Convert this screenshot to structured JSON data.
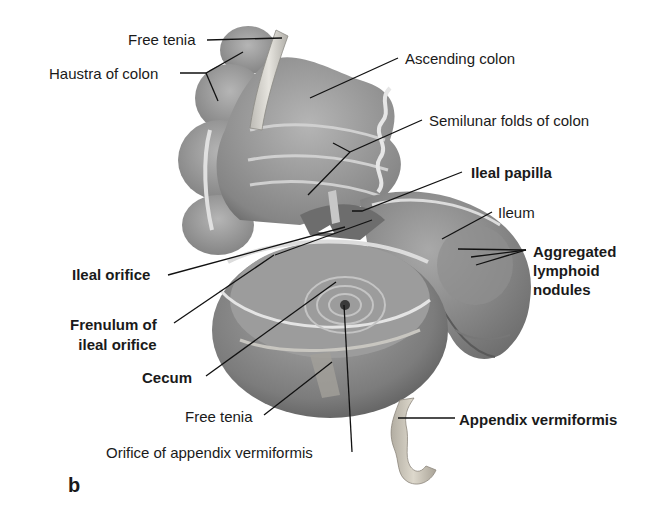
{
  "figure": {
    "panel_letter": "b",
    "colors": {
      "background": "#ffffff",
      "tissue_dark": "#6e6e6e",
      "tissue_mid": "#9a9a9a",
      "tissue_light": "#c8c8c8",
      "tenia_band": "#d8d6d0",
      "appendix": "#c9c4b8",
      "label_text": "#1a1a1a",
      "leader_line": "#111111"
    },
    "labels": [
      {
        "id": "free-tenia-top",
        "text": "Free tenia",
        "bold": false
      },
      {
        "id": "haustra-of-colon",
        "text": "Haustra of colon",
        "bold": false
      },
      {
        "id": "ascending-colon",
        "text": "Ascending colon",
        "bold": false
      },
      {
        "id": "semilunar-folds",
        "text": "Semilunar folds of colon",
        "bold": false
      },
      {
        "id": "ileal-papilla",
        "text": "Ileal papilla",
        "bold": true
      },
      {
        "id": "ileum",
        "text": "Ileum",
        "bold": false
      },
      {
        "id": "aggregated-lymphoid-nodules",
        "text": "Aggregated lymphoid nodules",
        "lines": [
          "Aggregated",
          "lymphoid",
          "nodules"
        ],
        "bold": true
      },
      {
        "id": "ileal-orifice",
        "text": "Ileal orifice",
        "bold": true
      },
      {
        "id": "frenulum-of-ileal-orifice",
        "text": "Frenulum of ileal orifice",
        "lines": [
          "Frenulum of",
          "ileal orifice"
        ],
        "bold": true
      },
      {
        "id": "cecum",
        "text": "Cecum",
        "bold": true
      },
      {
        "id": "free-tenia-bottom",
        "text": "Free tenia",
        "bold": false
      },
      {
        "id": "orifice-of-appendix",
        "text": "Orifice of appendix vermiformis",
        "bold": false
      },
      {
        "id": "appendix-vermiformis",
        "text": "Appendix vermiformis",
        "bold": true
      }
    ]
  }
}
